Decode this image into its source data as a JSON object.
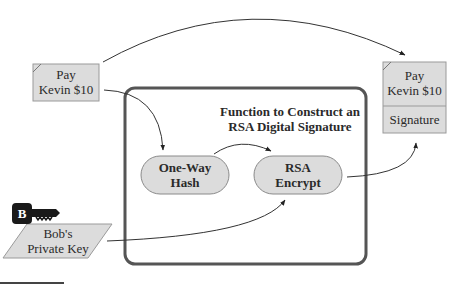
{
  "diagram": {
    "type": "flow",
    "message_box": {
      "line1": "Pay",
      "line2": "Kevin $10"
    },
    "function_frame": {
      "title_line1": "Function to Construct an",
      "title_line2": "RSA Digital Signature"
    },
    "hash_node": {
      "line1": "One-Way",
      "line2": "Hash"
    },
    "encrypt_node": {
      "line1": "RSA",
      "line2": "Encrypt"
    },
    "key_icon": {
      "letter": "B"
    },
    "private_key": {
      "line1": "Bob's",
      "line2": "Private Key"
    },
    "signed_message": {
      "line1": "Pay",
      "line2": "Kevin $10",
      "signature": "Signature"
    },
    "colors": {
      "box_fill": "#dcdcdc",
      "frame_stroke": "#555555",
      "line": "#333333"
    }
  }
}
